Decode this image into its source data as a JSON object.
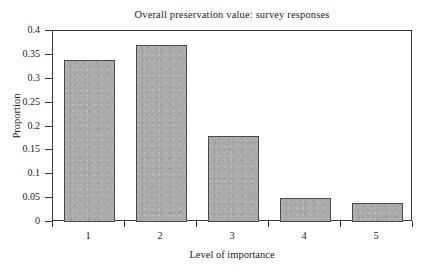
{
  "chart_data": {
    "type": "bar",
    "title": "Overall preservation value: survey responses",
    "xlabel": "Level of importance",
    "ylabel": "Proportion",
    "categories": [
      "1",
      "2",
      "3",
      "4",
      "5"
    ],
    "values": [
      0.34,
      0.37,
      0.18,
      0.05,
      0.04
    ],
    "ylim": [
      0,
      0.4
    ],
    "yticks": [
      "0",
      "0.05",
      "0.1",
      "0.15",
      "0.2",
      "0.25",
      "0.3",
      "0.35",
      "0.4"
    ],
    "ytick_values": [
      0,
      0.05,
      0.1,
      0.15,
      0.2,
      0.25,
      0.3,
      0.35,
      0.4
    ],
    "grid": false,
    "legend": null,
    "bar_fill_color": "#a9a9a9",
    "bar_border_color": "#4a4a4a",
    "axis_color": "#3a3a3a",
    "background_color": "#ffffff"
  }
}
